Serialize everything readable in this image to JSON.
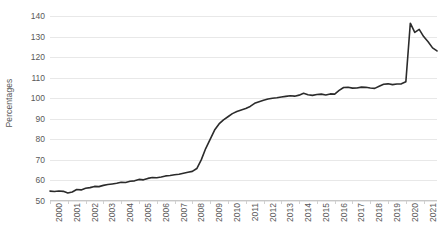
{
  "chart_data": {
    "type": "line",
    "title": "",
    "xlabel": "",
    "ylabel": "Percentages",
    "ylim": [
      50,
      140
    ],
    "ytick_values": [
      50,
      60,
      70,
      80,
      90,
      100,
      110,
      120,
      130,
      140
    ],
    "ytick_labels": [
      "50",
      "60",
      "70",
      "80",
      "90",
      "100",
      "110",
      "120",
      "130",
      "140"
    ],
    "grid": true,
    "legend": false,
    "legend_position": "none",
    "xlim": [
      2000,
      2021.75
    ],
    "categories": [
      "2000",
      "2001",
      "2002",
      "2003",
      "2004",
      "2005",
      "2006",
      "2007",
      "2008",
      "2009",
      "2010",
      "2011",
      "2012",
      "2013",
      "2014",
      "2015",
      "2016",
      "2017",
      "2018",
      "2019",
      "2020",
      "2021"
    ],
    "line_color": "#2b2b2b",
    "line_width": 1.6,
    "series": [
      {
        "name": "Percentages",
        "x": [
          2000.0,
          2000.25,
          2000.5,
          2000.75,
          2001.0,
          2001.25,
          2001.5,
          2001.75,
          2002.0,
          2002.25,
          2002.5,
          2002.75,
          2003.0,
          2003.25,
          2003.5,
          2003.75,
          2004.0,
          2004.25,
          2004.5,
          2004.75,
          2005.0,
          2005.25,
          2005.5,
          2005.75,
          2006.0,
          2006.25,
          2006.5,
          2006.75,
          2007.0,
          2007.25,
          2007.5,
          2007.75,
          2008.0,
          2008.25,
          2008.5,
          2008.75,
          2009.0,
          2009.25,
          2009.5,
          2009.75,
          2010.0,
          2010.25,
          2010.5,
          2010.75,
          2011.0,
          2011.25,
          2011.5,
          2011.75,
          2012.0,
          2012.25,
          2012.5,
          2012.75,
          2013.0,
          2013.25,
          2013.5,
          2013.75,
          2014.0,
          2014.25,
          2014.5,
          2014.75,
          2015.0,
          2015.25,
          2015.5,
          2015.75,
          2016.0,
          2016.25,
          2016.5,
          2016.75,
          2017.0,
          2017.25,
          2017.5,
          2017.75,
          2018.0,
          2018.25,
          2018.5,
          2018.75,
          2019.0,
          2019.25,
          2019.5,
          2019.75,
          2020.0,
          2020.25,
          2020.5,
          2020.75,
          2021.0,
          2021.25,
          2021.5,
          2021.75
        ],
        "values": [
          54.8,
          54.6,
          54.9,
          54.7,
          53.9,
          54.4,
          55.6,
          55.4,
          56.2,
          56.5,
          57.1,
          57.0,
          57.6,
          58.0,
          58.3,
          58.6,
          59.1,
          59.0,
          59.6,
          59.8,
          60.5,
          60.3,
          61.0,
          61.4,
          61.3,
          61.7,
          62.2,
          62.4,
          62.8,
          63.0,
          63.5,
          64.0,
          64.4,
          65.8,
          70.0,
          75.5,
          80.0,
          84.5,
          87.5,
          89.5,
          91.0,
          92.5,
          93.5,
          94.3,
          95.0,
          96.0,
          97.5,
          98.3,
          99.0,
          99.6,
          100.0,
          100.2,
          100.6,
          100.9,
          101.2,
          101.0,
          101.5,
          102.4,
          101.7,
          101.4,
          101.8,
          102.0,
          101.6,
          102.1,
          102.0,
          103.8,
          105.2,
          105.3,
          104.9,
          105.0,
          105.4,
          105.3,
          105.0,
          104.8,
          105.8,
          106.8,
          107.0,
          106.6,
          106.9,
          107.0,
          108.0,
          136.5,
          132.0,
          133.5,
          130.0,
          127.5,
          124.5,
          123.0
        ]
      }
    ]
  }
}
